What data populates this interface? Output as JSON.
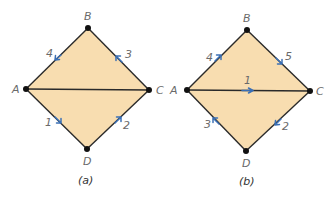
{
  "colors": {
    "fill": "#f8ddb0",
    "edge": "#2a2a2a",
    "node": "#111111",
    "arrow": "#3a6fb5",
    "label": "#6a6a6a",
    "background": "#ffffff"
  },
  "diagrams": [
    {
      "caption": "(a)",
      "nodes": {
        "A": {
          "label": "A",
          "x": 26,
          "y": 89
        },
        "B": {
          "label": "B",
          "x": 88,
          "y": 28
        },
        "C": {
          "label": "C",
          "x": 149,
          "y": 90
        },
        "D": {
          "label": "D",
          "x": 87,
          "y": 149
        }
      },
      "edges": [
        {
          "from": "A",
          "to": "B",
          "arrow": {
            "label": "4",
            "toward": "A"
          }
        },
        {
          "from": "B",
          "to": "C",
          "arrow": {
            "label": "3",
            "toward": "B"
          }
        },
        {
          "from": "C",
          "to": "D",
          "arrow": {
            "label": "2",
            "toward": "C"
          }
        },
        {
          "from": "D",
          "to": "A",
          "arrow": {
            "label": "1",
            "toward": "D"
          }
        },
        {
          "from": "A",
          "to": "C",
          "arrow": null
        }
      ]
    },
    {
      "caption": "(b)",
      "nodes": {
        "A": {
          "label": "A",
          "x": 187,
          "y": 90
        },
        "B": {
          "label": "B",
          "x": 247,
          "y": 30
        },
        "C": {
          "label": "C",
          "x": 310,
          "y": 91
        },
        "D": {
          "label": "D",
          "x": 246,
          "y": 151
        }
      },
      "edges": [
        {
          "from": "A",
          "to": "B",
          "arrow": {
            "label": "4",
            "toward": "B"
          }
        },
        {
          "from": "B",
          "to": "C",
          "arrow": {
            "label": "5",
            "toward": "C"
          }
        },
        {
          "from": "C",
          "to": "D",
          "arrow": {
            "label": "2",
            "toward": "D"
          }
        },
        {
          "from": "D",
          "to": "A",
          "arrow": {
            "label": "3",
            "toward": "A"
          }
        },
        {
          "from": "A",
          "to": "C",
          "arrow": {
            "label": "1",
            "toward": "C"
          }
        }
      ]
    }
  ]
}
